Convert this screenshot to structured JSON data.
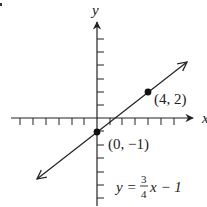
{
  "figure": {
    "type": "coordinate-graph",
    "axes": {
      "x_label": "x",
      "y_label": "y",
      "x_ticks_negative": 6,
      "x_ticks_positive": 6,
      "y_ticks_positive": 6,
      "y_ticks_negative": 6
    },
    "line": {
      "equation_lhs": "y =",
      "equation_frac_num": "3",
      "equation_frac_den": "4",
      "equation_rhs": "x − 1",
      "slope": "3/4",
      "intercept": -1
    },
    "points": [
      {
        "label": "(4, 2)",
        "x": 4,
        "y": 2
      },
      {
        "label": "(0, −1)",
        "x": 0,
        "y": -1
      }
    ],
    "colors": {
      "ink": "#222222",
      "background": "#ffffff"
    }
  }
}
